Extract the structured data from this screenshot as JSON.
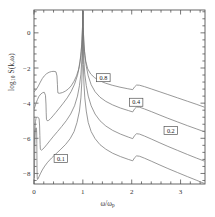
{
  "figure": {
    "axis_color": "#555555",
    "curve_color": "#777777",
    "background": "#ffffff"
  },
  "axes": {
    "y_label_prefix": "log",
    "y_label_sub": "10",
    "y_label_suffix": " S(k,ω)",
    "x_label_num": "ω",
    "x_label_den": "ω",
    "x_label_den_sub": "p",
    "x_ticks": [
      "0",
      "1",
      "2",
      "3"
    ],
    "y_ticks": [
      "0",
      "−2",
      "−4",
      "−6",
      "−8"
    ]
  },
  "chart_data": {
    "type": "line",
    "title": "",
    "xlabel": "ω/ω_p",
    "ylabel": "log10 S(k,ω)",
    "xlim": [
      0,
      3.5
    ],
    "ylim": [
      -8.6,
      1.3
    ],
    "grid": false,
    "legend": "inline-labels",
    "x_ticks": [
      0,
      1,
      2,
      3
    ],
    "y_ticks": [
      0,
      -2,
      -4,
      -6,
      -8
    ],
    "x_minor_tick_step": 0.2,
    "y_minor_tick_step": 0.4,
    "series": [
      {
        "name": "0.8",
        "label": "0.8",
        "label_x": 1.42,
        "label_y": -2.55,
        "points": [
          [
            0.005,
            -3.35
          ],
          [
            0.02,
            -3.3
          ],
          [
            0.05,
            -3.2
          ],
          [
            0.09,
            -3.02
          ],
          [
            0.13,
            -2.8
          ],
          [
            0.17,
            -2.6
          ],
          [
            0.21,
            -2.45
          ],
          [
            0.26,
            -2.32
          ],
          [
            0.31,
            -2.24
          ],
          [
            0.36,
            -2.2
          ],
          [
            0.41,
            -2.19
          ],
          [
            0.45,
            -2.22
          ],
          [
            0.47,
            -2.45
          ],
          [
            0.48,
            -2.95
          ],
          [
            0.485,
            -3.3
          ],
          [
            0.49,
            -3.42
          ],
          [
            0.52,
            -3.44
          ],
          [
            0.58,
            -3.4
          ],
          [
            0.64,
            -3.32
          ],
          [
            0.7,
            -3.2
          ],
          [
            0.76,
            -3.02
          ],
          [
            0.82,
            -2.75
          ],
          [
            0.87,
            -2.45
          ],
          [
            0.91,
            -2.1
          ],
          [
            0.94,
            -1.65
          ],
          [
            0.965,
            -1.05
          ],
          [
            0.982,
            -0.4
          ],
          [
            0.993,
            0.35
          ],
          [
            0.998,
            0.95
          ],
          [
            1.0,
            1.25
          ],
          [
            1.002,
            0.95
          ],
          [
            1.007,
            0.35
          ],
          [
            1.018,
            -0.4
          ],
          [
            1.035,
            -1.05
          ],
          [
            1.06,
            -1.62
          ],
          [
            1.1,
            -2.05
          ],
          [
            1.16,
            -2.34
          ],
          [
            1.24,
            -2.55
          ],
          [
            1.34,
            -2.72
          ],
          [
            1.46,
            -2.86
          ],
          [
            1.6,
            -2.98
          ],
          [
            1.76,
            -3.09
          ],
          [
            1.92,
            -3.18
          ],
          [
            2.02,
            -3.23
          ],
          [
            2.06,
            -3.07
          ],
          [
            2.1,
            -2.97
          ],
          [
            2.16,
            -2.98
          ],
          [
            2.26,
            -3.06
          ],
          [
            2.4,
            -3.19
          ],
          [
            2.56,
            -3.34
          ],
          [
            2.74,
            -3.51
          ],
          [
            2.94,
            -3.7
          ],
          [
            3.14,
            -3.89
          ],
          [
            3.32,
            -4.06
          ],
          [
            3.48,
            -4.22
          ]
        ]
      },
      {
        "name": "0.4",
        "label": "0.4",
        "label_x": 2.09,
        "label_y": -3.95,
        "points": [
          [
            0.005,
            -4.3
          ],
          [
            0.02,
            -4.2
          ],
          [
            0.04,
            -4.02
          ],
          [
            0.07,
            -3.8
          ],
          [
            0.1,
            -3.62
          ],
          [
            0.14,
            -3.48
          ],
          [
            0.18,
            -3.4
          ],
          [
            0.21,
            -3.38
          ],
          [
            0.235,
            -3.55
          ],
          [
            0.245,
            -4.05
          ],
          [
            0.25,
            -4.55
          ],
          [
            0.255,
            -4.92
          ],
          [
            0.27,
            -5.0
          ],
          [
            0.3,
            -4.98
          ],
          [
            0.34,
            -4.88
          ],
          [
            0.39,
            -4.72
          ],
          [
            0.45,
            -4.52
          ],
          [
            0.52,
            -4.28
          ],
          [
            0.6,
            -4.0
          ],
          [
            0.68,
            -3.7
          ],
          [
            0.76,
            -3.34
          ],
          [
            0.83,
            -2.92
          ],
          [
            0.89,
            -2.42
          ],
          [
            0.93,
            -1.9
          ],
          [
            0.96,
            -1.3
          ],
          [
            0.978,
            -0.65
          ],
          [
            0.99,
            0.1
          ],
          [
            0.997,
            0.75
          ],
          [
            1.0,
            1.25
          ],
          [
            1.003,
            0.75
          ],
          [
            1.01,
            0.1
          ],
          [
            1.022,
            -0.65
          ],
          [
            1.04,
            -1.3
          ],
          [
            1.07,
            -1.9
          ],
          [
            1.11,
            -2.45
          ],
          [
            1.17,
            -2.95
          ],
          [
            1.25,
            -3.35
          ],
          [
            1.35,
            -3.66
          ],
          [
            1.47,
            -3.9
          ],
          [
            1.61,
            -4.1
          ],
          [
            1.77,
            -4.28
          ],
          [
            1.93,
            -4.42
          ],
          [
            2.02,
            -4.5
          ],
          [
            2.06,
            -4.32
          ],
          [
            2.1,
            -4.22
          ],
          [
            2.16,
            -4.23
          ],
          [
            2.26,
            -4.33
          ],
          [
            2.4,
            -4.48
          ],
          [
            2.56,
            -4.66
          ],
          [
            2.74,
            -4.86
          ],
          [
            2.94,
            -5.07
          ],
          [
            3.14,
            -5.28
          ],
          [
            3.32,
            -5.46
          ],
          [
            3.48,
            -5.62
          ]
        ]
      },
      {
        "name": "0.2",
        "label": "0.2",
        "label_x": 2.8,
        "label_y": -5.55,
        "points": [
          [
            0.005,
            -6.35
          ],
          [
            0.012,
            -5.95
          ],
          [
            0.02,
            -5.45
          ],
          [
            0.03,
            -5.05
          ],
          [
            0.04,
            -4.88
          ],
          [
            0.05,
            -4.82
          ],
          [
            0.07,
            -4.8
          ],
          [
            0.09,
            -4.82
          ],
          [
            0.105,
            -4.9
          ],
          [
            0.115,
            -5.3
          ],
          [
            0.12,
            -5.85
          ],
          [
            0.125,
            -6.35
          ],
          [
            0.13,
            -6.62
          ],
          [
            0.15,
            -6.68
          ],
          [
            0.18,
            -6.62
          ],
          [
            0.22,
            -6.5
          ],
          [
            0.27,
            -6.33
          ],
          [
            0.33,
            -6.12
          ],
          [
            0.4,
            -5.88
          ],
          [
            0.48,
            -5.62
          ],
          [
            0.57,
            -5.32
          ],
          [
            0.66,
            -5.0
          ],
          [
            0.75,
            -4.62
          ],
          [
            0.83,
            -4.15
          ],
          [
            0.89,
            -3.6
          ],
          [
            0.93,
            -3.0
          ],
          [
            0.96,
            -2.35
          ],
          [
            0.978,
            -1.6
          ],
          [
            0.99,
            -0.75
          ],
          [
            0.997,
            0.35
          ],
          [
            1.0,
            1.25
          ],
          [
            1.003,
            0.35
          ],
          [
            1.01,
            -0.75
          ],
          [
            1.022,
            -1.6
          ],
          [
            1.04,
            -2.35
          ],
          [
            1.07,
            -3.0
          ],
          [
            1.11,
            -3.6
          ],
          [
            1.17,
            -4.15
          ],
          [
            1.25,
            -4.62
          ],
          [
            1.35,
            -5.0
          ],
          [
            1.47,
            -5.3
          ],
          [
            1.61,
            -5.55
          ],
          [
            1.77,
            -5.76
          ],
          [
            1.93,
            -5.93
          ],
          [
            2.02,
            -6.02
          ],
          [
            2.06,
            -5.84
          ],
          [
            2.1,
            -5.74
          ],
          [
            2.16,
            -5.76
          ],
          [
            2.26,
            -5.87
          ],
          [
            2.4,
            -6.04
          ],
          [
            2.56,
            -6.24
          ],
          [
            2.74,
            -6.46
          ],
          [
            2.94,
            -6.69
          ],
          [
            3.14,
            -6.92
          ],
          [
            3.32,
            -7.12
          ],
          [
            3.48,
            -7.29
          ]
        ]
      },
      {
        "name": "0.1",
        "label": "0.1",
        "label_x": 0.55,
        "label_y": -7.15,
        "points": [
          [
            0.008,
            -8.25
          ],
          [
            0.012,
            -7.4
          ],
          [
            0.016,
            -6.6
          ],
          [
            0.02,
            -6.0
          ],
          [
            0.025,
            -5.62
          ],
          [
            0.03,
            -5.45
          ],
          [
            0.04,
            -5.4
          ],
          [
            0.05,
            -5.42
          ],
          [
            0.055,
            -5.7
          ],
          [
            0.058,
            -6.3
          ],
          [
            0.06,
            -7.0
          ],
          [
            0.062,
            -7.7
          ],
          [
            0.065,
            -8.18
          ],
          [
            0.07,
            -8.34
          ],
          [
            0.08,
            -8.32
          ],
          [
            0.1,
            -8.2
          ],
          [
            0.13,
            -8.02
          ],
          [
            0.17,
            -7.8
          ],
          [
            0.22,
            -7.58
          ],
          [
            0.28,
            -7.36
          ],
          [
            0.36,
            -7.12
          ],
          [
            0.45,
            -6.88
          ],
          [
            0.55,
            -6.62
          ],
          [
            0.65,
            -6.34
          ],
          [
            0.74,
            -6.02
          ],
          [
            0.82,
            -5.62
          ],
          [
            0.88,
            -5.1
          ],
          [
            0.93,
            -4.45
          ],
          [
            0.96,
            -3.7
          ],
          [
            0.978,
            -2.85
          ],
          [
            0.99,
            -1.8
          ],
          [
            0.997,
            -0.45
          ],
          [
            1.0,
            1.25
          ],
          [
            1.003,
            -0.45
          ],
          [
            1.01,
            -1.8
          ],
          [
            1.022,
            -2.85
          ],
          [
            1.04,
            -3.7
          ],
          [
            1.07,
            -4.45
          ],
          [
            1.11,
            -5.1
          ],
          [
            1.17,
            -5.62
          ],
          [
            1.25,
            -6.02
          ],
          [
            1.35,
            -6.36
          ],
          [
            1.47,
            -6.62
          ],
          [
            1.61,
            -6.85
          ],
          [
            1.77,
            -7.04
          ],
          [
            1.93,
            -7.2
          ],
          [
            2.02,
            -7.28
          ],
          [
            2.06,
            -7.1
          ],
          [
            2.1,
            -7.0
          ],
          [
            2.16,
            -7.02
          ],
          [
            2.26,
            -7.13
          ],
          [
            2.4,
            -7.3
          ],
          [
            2.56,
            -7.5
          ],
          [
            2.74,
            -7.72
          ],
          [
            2.94,
            -7.95
          ],
          [
            3.14,
            -8.18
          ],
          [
            3.32,
            -8.38
          ],
          [
            3.48,
            -8.56
          ]
        ]
      }
    ]
  }
}
